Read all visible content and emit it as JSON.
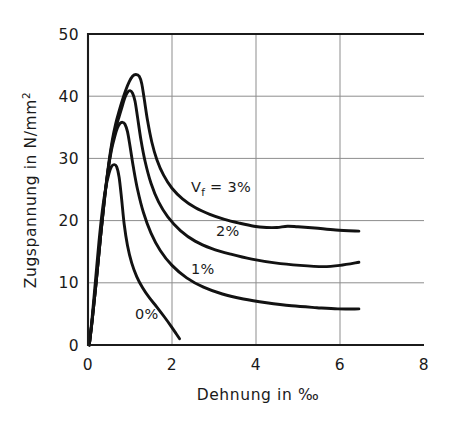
{
  "chart_data": {
    "type": "line",
    "title": "",
    "xlabel": "Dehnung in ‰",
    "ylabel": "Zugspannung in N/mm²",
    "ylabel_main": "Zugspannung  in  N/mm",
    "ylabel_exponent": "2",
    "xlabel_main": "Dehnung  in  ‰",
    "xlim": [
      0,
      8
    ],
    "ylim": [
      0,
      50
    ],
    "xticks": [
      "0",
      "2",
      "4",
      "6",
      "8"
    ],
    "xtick_values": [
      0,
      2,
      4,
      6,
      8
    ],
    "yticks": [
      "0",
      "10",
      "20",
      "30",
      "40",
      "50"
    ],
    "ytick_values": [
      0,
      10,
      20,
      30,
      40,
      50
    ],
    "grid": true,
    "legend_position": "inline-annotations",
    "series": [
      {
        "name": "Vf = 3%",
        "label_prefix": "V",
        "label_subscript": "f",
        "label_suffix": "= 3%",
        "label_full": "Vf = 3%",
        "label_x": 2.45,
        "label_y": 24.6,
        "points": [
          [
            0.03,
            0.0
          ],
          [
            0.1,
            4.0
          ],
          [
            0.2,
            10.5
          ],
          [
            0.3,
            17.5
          ],
          [
            0.4,
            24.0
          ],
          [
            0.5,
            29.5
          ],
          [
            0.58,
            33.0
          ],
          [
            0.66,
            35.6
          ],
          [
            0.74,
            37.6
          ],
          [
            0.82,
            39.4
          ],
          [
            0.9,
            41.0
          ],
          [
            0.98,
            42.3
          ],
          [
            1.06,
            43.2
          ],
          [
            1.14,
            43.5
          ],
          [
            1.22,
            43.2
          ],
          [
            1.28,
            42.0
          ],
          [
            1.34,
            39.5
          ],
          [
            1.42,
            36.0
          ],
          [
            1.52,
            32.6
          ],
          [
            1.64,
            29.8
          ],
          [
            1.8,
            27.3
          ],
          [
            2.0,
            25.2
          ],
          [
            2.25,
            23.5
          ],
          [
            2.55,
            22.1
          ],
          [
            2.9,
            21.0
          ],
          [
            3.25,
            20.2
          ],
          [
            3.6,
            19.6
          ],
          [
            3.95,
            19.1
          ],
          [
            4.25,
            18.9
          ],
          [
            4.5,
            18.9
          ],
          [
            4.75,
            19.1
          ],
          [
            5.0,
            19.0
          ],
          [
            5.4,
            18.8
          ],
          [
            5.9,
            18.5
          ],
          [
            6.45,
            18.3
          ]
        ]
      },
      {
        "name": "2%",
        "label_full": "2%",
        "label_x": 3.05,
        "label_y": 17.6,
        "points": [
          [
            0.03,
            0.0
          ],
          [
            0.1,
            4.0
          ],
          [
            0.2,
            10.5
          ],
          [
            0.3,
            17.5
          ],
          [
            0.4,
            24.0
          ],
          [
            0.5,
            29.2
          ],
          [
            0.58,
            32.5
          ],
          [
            0.66,
            34.8
          ],
          [
            0.74,
            36.7
          ],
          [
            0.82,
            38.5
          ],
          [
            0.88,
            39.8
          ],
          [
            0.94,
            40.6
          ],
          [
            1.0,
            40.9
          ],
          [
            1.06,
            40.5
          ],
          [
            1.12,
            39.2
          ],
          [
            1.18,
            36.6
          ],
          [
            1.26,
            33.0
          ],
          [
            1.36,
            29.5
          ],
          [
            1.5,
            26.0
          ],
          [
            1.68,
            23.0
          ],
          [
            1.9,
            20.6
          ],
          [
            2.2,
            18.4
          ],
          [
            2.55,
            16.7
          ],
          [
            2.95,
            15.5
          ],
          [
            3.4,
            14.6
          ],
          [
            3.9,
            13.8
          ],
          [
            4.45,
            13.2
          ],
          [
            5.05,
            12.8
          ],
          [
            5.6,
            12.6
          ],
          [
            6.0,
            12.8
          ],
          [
            6.45,
            13.3
          ]
        ]
      },
      {
        "name": "1%",
        "label_full": "1%",
        "label_x": 2.45,
        "label_y": 11.4,
        "points": [
          [
            0.03,
            0.0
          ],
          [
            0.1,
            4.0
          ],
          [
            0.2,
            10.5
          ],
          [
            0.3,
            17.5
          ],
          [
            0.4,
            23.8
          ],
          [
            0.48,
            28.2
          ],
          [
            0.56,
            31.4
          ],
          [
            0.64,
            33.6
          ],
          [
            0.7,
            34.9
          ],
          [
            0.76,
            35.6
          ],
          [
            0.82,
            35.8
          ],
          [
            0.88,
            35.5
          ],
          [
            0.94,
            34.3
          ],
          [
            1.0,
            32.0
          ],
          [
            1.08,
            28.6
          ],
          [
            1.18,
            25.0
          ],
          [
            1.32,
            21.3
          ],
          [
            1.5,
            18.0
          ],
          [
            1.72,
            15.2
          ],
          [
            2.0,
            12.8
          ],
          [
            2.35,
            10.8
          ],
          [
            2.75,
            9.3
          ],
          [
            3.2,
            8.2
          ],
          [
            3.7,
            7.4
          ],
          [
            4.25,
            6.8
          ],
          [
            4.85,
            6.3
          ],
          [
            5.45,
            6.0
          ],
          [
            5.95,
            5.8
          ],
          [
            6.45,
            5.8
          ]
        ]
      },
      {
        "name": "0%",
        "label_full": "0%",
        "label_x": 1.12,
        "label_y": 4.2,
        "points": [
          [
            0.03,
            0.0
          ],
          [
            0.1,
            4.5
          ],
          [
            0.18,
            10.5
          ],
          [
            0.26,
            16.5
          ],
          [
            0.34,
            21.5
          ],
          [
            0.42,
            25.2
          ],
          [
            0.5,
            27.6
          ],
          [
            0.56,
            28.7
          ],
          [
            0.62,
            29.0
          ],
          [
            0.68,
            28.7
          ],
          [
            0.74,
            27.0
          ],
          [
            0.8,
            23.5
          ],
          [
            0.86,
            19.5
          ],
          [
            0.94,
            16.0
          ],
          [
            1.04,
            13.2
          ],
          [
            1.16,
            11.0
          ],
          [
            1.3,
            9.2
          ],
          [
            1.46,
            7.6
          ],
          [
            1.64,
            6.1
          ],
          [
            1.82,
            4.5
          ],
          [
            1.98,
            3.0
          ],
          [
            2.1,
            1.8
          ],
          [
            2.18,
            1.0
          ]
        ]
      }
    ]
  }
}
